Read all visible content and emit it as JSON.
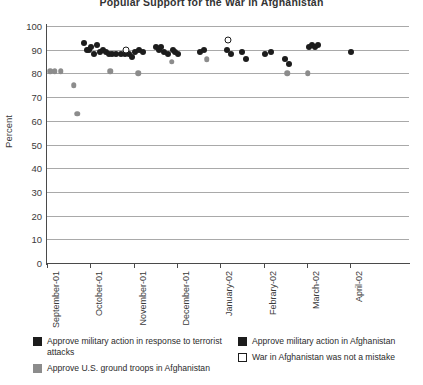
{
  "chart_data": {
    "type": "scatter",
    "title": "Popular Support for the War in Afghanistan",
    "xlabel": "",
    "ylabel": "Percent",
    "ylim": [
      0,
      100
    ],
    "ytick_step": 10,
    "yticks": [
      0,
      10,
      20,
      30,
      40,
      50,
      60,
      70,
      80,
      90,
      100
    ],
    "categories": [
      "September-01",
      "October-01",
      "November-01",
      "December-01",
      "January-02",
      "Febrary-02",
      "March-02",
      "April-02"
    ],
    "grid": true,
    "legend_position": "bottom",
    "colors": {
      "dark": "#1c1c1c",
      "gray": "#8c8c8c",
      "open": "#ffffff",
      "gridline": "#a9a9a9",
      "axis": "#4a4a4a"
    },
    "series": [
      {
        "name": "Approve military action in response to terrorist attacks",
        "marker": "filled-circle-dark",
        "color": "#1c1c1c",
        "points": [
          {
            "x": 0.86,
            "y": 93
          },
          {
            "x": 0.92,
            "y": 90
          },
          {
            "x": 0.97,
            "y": 90
          },
          {
            "x": 1.02,
            "y": 91
          },
          {
            "x": 1.08,
            "y": 88
          },
          {
            "x": 1.16,
            "y": 92
          },
          {
            "x": 1.22,
            "y": 89
          },
          {
            "x": 1.3,
            "y": 90
          },
          {
            "x": 1.36,
            "y": 89
          },
          {
            "x": 1.42,
            "y": 88
          },
          {
            "x": 1.5,
            "y": 88
          },
          {
            "x": 1.6,
            "y": 88
          },
          {
            "x": 1.7,
            "y": 88
          },
          {
            "x": 1.8,
            "y": 88
          },
          {
            "x": 1.88,
            "y": 88
          },
          {
            "x": 1.96,
            "y": 87
          },
          {
            "x": 2.02,
            "y": 89
          },
          {
            "x": 2.12,
            "y": 90
          },
          {
            "x": 2.22,
            "y": 89
          },
          {
            "x": 2.52,
            "y": 91
          },
          {
            "x": 2.58,
            "y": 90
          },
          {
            "x": 2.64,
            "y": 91
          },
          {
            "x": 2.7,
            "y": 89
          },
          {
            "x": 2.8,
            "y": 88
          },
          {
            "x": 2.9,
            "y": 90
          },
          {
            "x": 2.96,
            "y": 89
          },
          {
            "x": 3.02,
            "y": 88
          },
          {
            "x": 3.52,
            "y": 89
          },
          {
            "x": 3.62,
            "y": 90
          },
          {
            "x": 4.16,
            "y": 90
          },
          {
            "x": 4.24,
            "y": 88
          },
          {
            "x": 4.5,
            "y": 89
          },
          {
            "x": 4.6,
            "y": 86
          },
          {
            "x": 5.02,
            "y": 88
          },
          {
            "x": 5.16,
            "y": 89
          },
          {
            "x": 5.5,
            "y": 86
          },
          {
            "x": 5.58,
            "y": 84
          },
          {
            "x": 6.04,
            "y": 91
          },
          {
            "x": 6.12,
            "y": 92
          },
          {
            "x": 6.18,
            "y": 91
          },
          {
            "x": 6.24,
            "y": 92
          },
          {
            "x": 7.02,
            "y": 89
          }
        ]
      },
      {
        "name": "Approve U.S. ground troops in Afghanistan",
        "marker": "filled-circle-gray",
        "color": "#8c8c8c",
        "points": [
          {
            "x": 0.08,
            "y": 81
          },
          {
            "x": 0.18,
            "y": 81
          },
          {
            "x": 0.32,
            "y": 81
          },
          {
            "x": 0.62,
            "y": 75
          },
          {
            "x": 0.7,
            "y": 63
          },
          {
            "x": 1.46,
            "y": 81
          },
          {
            "x": 2.1,
            "y": 80
          },
          {
            "x": 2.88,
            "y": 85
          },
          {
            "x": 3.68,
            "y": 86
          },
          {
            "x": 5.54,
            "y": 80
          },
          {
            "x": 6.02,
            "y": 80
          }
        ]
      },
      {
        "name": "Approve military action in Afghanistan",
        "marker": "filled-circle-dark",
        "color": "#1c1c1c",
        "points": []
      },
      {
        "name": "War in Afghanistan was not a mistake",
        "marker": "open-square",
        "color": "#ffffff",
        "points": [
          {
            "x": 1.82,
            "y": 90
          },
          {
            "x": 4.18,
            "y": 94
          }
        ]
      }
    ]
  },
  "legend": {
    "items": [
      {
        "id": "terrorist-attacks",
        "swatch": "dark",
        "label": "Approve military action in response to terrorist attacks"
      },
      {
        "id": "ground-troops",
        "swatch": "gray",
        "label": "Approve U.S. ground troops in Afghanistan"
      },
      {
        "id": "military-action-afghanistan",
        "swatch": "dark",
        "label": "Approve military action in Afghanistan"
      },
      {
        "id": "not-a-mistake",
        "swatch": "open",
        "label": "War in Afghanistan was not a mistake"
      }
    ]
  }
}
